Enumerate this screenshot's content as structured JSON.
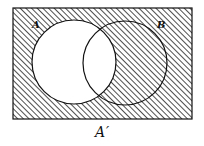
{
  "diagram": {
    "type": "venn",
    "title": "A′",
    "shaded_region": "complement of A",
    "universal_set": {
      "x": 13,
      "y": 8,
      "width": 179,
      "height": 111
    },
    "sets": [
      {
        "label": "A",
        "cx": 74,
        "cy": 62,
        "r": 42,
        "shaded": false
      },
      {
        "label": "B",
        "cx": 125,
        "cy": 63,
        "r": 42,
        "shaded": "outside A only"
      }
    ],
    "hatch": {
      "spacing": 4,
      "stroke": "#222222",
      "angle": 45
    },
    "colors": {
      "line": "#111111",
      "background": "#ffffff"
    }
  },
  "labels": {
    "a": "A",
    "b": "B",
    "caption": "A′"
  }
}
